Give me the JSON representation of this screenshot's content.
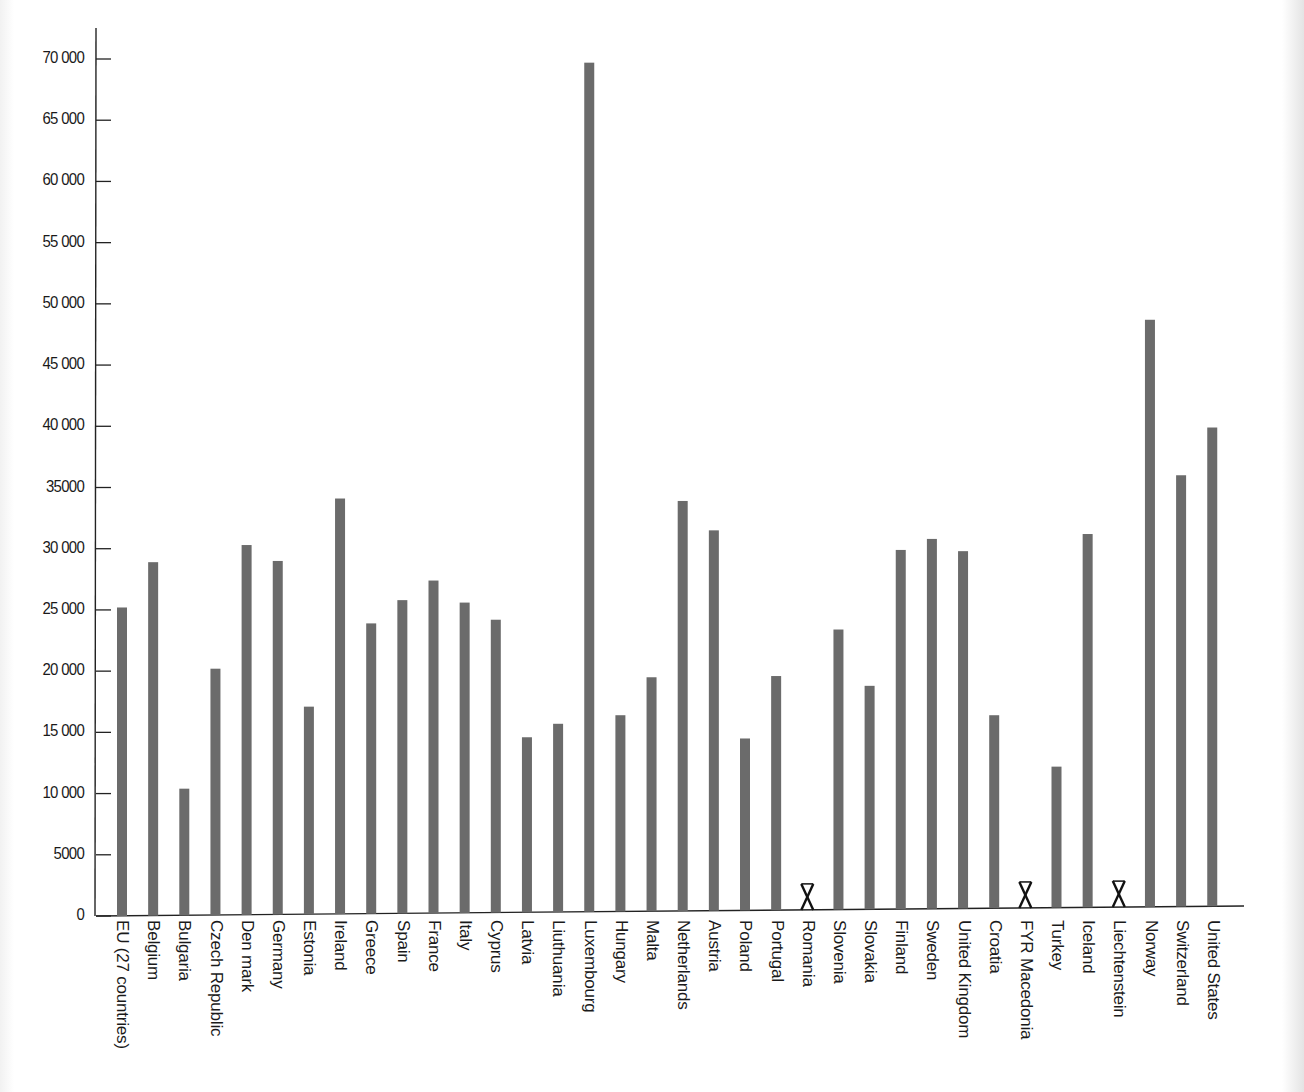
{
  "chart_data": {
    "type": "bar",
    "title": "",
    "xlabel": "",
    "ylabel": "",
    "ylim": [
      0,
      70000
    ],
    "yticks": [
      0,
      5000,
      10000,
      15000,
      20000,
      25000,
      30000,
      35000,
      40000,
      45000,
      50000,
      55000,
      60000,
      65000,
      70000
    ],
    "ytick_labels": [
      "0",
      "5000",
      "10 000",
      "15 000",
      "20 000",
      "25 000",
      "30 000",
      "35000",
      "40 000",
      "45 000",
      "50 000",
      "55 000",
      "60 000",
      "65 000",
      "70 000"
    ],
    "grid": false,
    "legend": null,
    "bar_color": "#6b6b6b",
    "missing_marker": "X",
    "categories": [
      "EU (27 countries)",
      "Belgium",
      "Bulgaria",
      "Czech Republic",
      "Den mark",
      "Germany",
      "Estonia",
      "Ireland",
      "Greece",
      "Spain",
      "France",
      "Italy",
      "Cyprus",
      "Latvia",
      "Liuthuania",
      "Luxembourg",
      "Hungary",
      "Malta",
      "Netherlands",
      "Austria",
      "Poland",
      "Portugal",
      "Romania",
      "Slovenia",
      "Slovakia",
      "Finland",
      "Sweden",
      "United Kingdom",
      "Croatia",
      "FYR Macedonia",
      "Turkey",
      "Iceland",
      "Liechtenstein",
      "Norway",
      "Switzerland",
      "United States"
    ],
    "values": [
      25200,
      28900,
      10400,
      20200,
      30300,
      29000,
      17100,
      34100,
      23900,
      25800,
      27400,
      25600,
      24200,
      14600,
      15700,
      69700,
      16400,
      19500,
      33900,
      31500,
      14500,
      19600,
      null,
      23400,
      18800,
      29900,
      30800,
      29800,
      16400,
      null,
      12200,
      31200,
      null,
      48700,
      36000,
      39900
    ]
  }
}
